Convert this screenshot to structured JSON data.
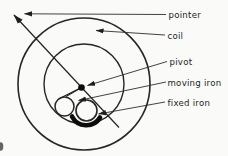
{
  "figure": {
    "type": "labeled-cross-section-diagram",
    "background_color": "#fafaf8",
    "ink_color": "#262626",
    "coil_fill_color": "#c9c9c9",
    "iron_fill_color": "#d8d8d8",
    "labels": [
      {
        "id": "pointer",
        "text": "pointer"
      },
      {
        "id": "coil",
        "text": "coil"
      },
      {
        "id": "pivot",
        "text": "pivot"
      },
      {
        "id": "moving-iron",
        "text": "moving iron"
      },
      {
        "id": "fixed-iron",
        "text": "fixed iron"
      }
    ]
  }
}
